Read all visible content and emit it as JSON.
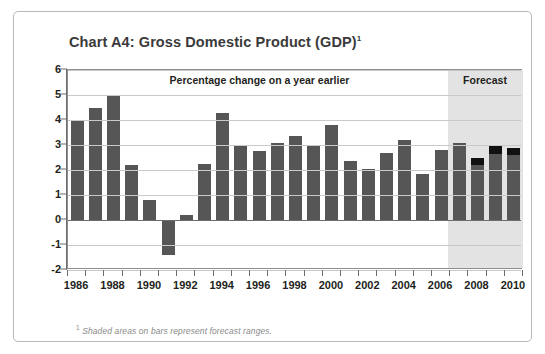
{
  "chart_data": {
    "type": "bar",
    "title": "Chart A4: Gross Domestic Product (GDP)",
    "title_superscript": "1",
    "banner_label": "Percentage change on a year earlier",
    "forecast_label": "Forecast",
    "xlabel": "",
    "ylabel": "",
    "ylim": [
      -2,
      6
    ],
    "yticks": [
      6,
      5,
      4,
      3,
      2,
      1,
      0,
      -1,
      -2
    ],
    "ytick_labels": [
      "6",
      "5",
      "4",
      "3",
      "2",
      "1",
      "0",
      "-1",
      "-2"
    ],
    "grid": true,
    "legend_position": "none",
    "x": [
      1986,
      1987,
      1988,
      1989,
      1990,
      1991,
      1992,
      1993,
      1994,
      1995,
      1996,
      1997,
      1998,
      1999,
      2000,
      2001,
      2002,
      2003,
      2004,
      2005,
      2006,
      2007,
      2008,
      2009,
      2010
    ],
    "xtick_labels": [
      "1986",
      "1988",
      "1990",
      "1992",
      "1994",
      "1996",
      "1998",
      "2000",
      "2002",
      "2004",
      "2006",
      "2008",
      "2010"
    ],
    "categories": [
      "1986",
      "1987",
      "1988",
      "1989",
      "1990",
      "1991",
      "1992",
      "1993",
      "1994",
      "1995",
      "1996",
      "1997",
      "1998",
      "1999",
      "2000",
      "2001",
      "2002",
      "2003",
      "2004",
      "2005",
      "2006",
      "2007",
      "2008",
      "2009",
      "2010"
    ],
    "values": [
      4.0,
      4.5,
      5.0,
      2.2,
      0.8,
      -1.4,
      0.2,
      2.25,
      4.3,
      2.95,
      2.75,
      3.1,
      3.35,
      3.0,
      3.8,
      2.35,
      2.05,
      2.7,
      3.2,
      1.85,
      2.8,
      3.1,
      2.5,
      2.95,
      2.9
    ],
    "series": [
      {
        "name": "GDP percentage change on a year earlier",
        "values": [
          4.0,
          4.5,
          5.0,
          2.2,
          0.8,
          -1.4,
          0.2,
          2.25,
          4.3,
          2.95,
          2.75,
          3.1,
          3.35,
          3.0,
          3.8,
          2.35,
          2.05,
          2.7,
          3.2,
          1.85,
          2.8,
          3.1,
          2.5,
          2.95,
          2.9
        ]
      }
    ],
    "forecast_start_year": 2007,
    "forecast_range_bars": [
      {
        "year": "2008",
        "low": 2.2,
        "high": 2.5
      },
      {
        "year": "2009",
        "low": 2.65,
        "high": 2.95
      },
      {
        "year": "2010",
        "low": 2.6,
        "high": 2.9
      }
    ],
    "bar_colors": {
      "solid": "#565656",
      "forecast_range": "#111111",
      "forecast_band": "#e3e3e3"
    },
    "annotations": [
      "Percentage change on a year earlier",
      "Forecast"
    ]
  },
  "footnote": {
    "marker": "1",
    "text": "Shaded areas on bars represent forecast ranges."
  }
}
